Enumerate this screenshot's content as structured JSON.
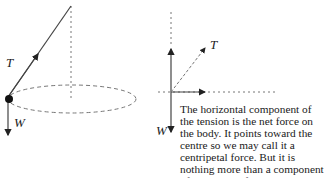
{
  "left_diagram": {
    "tension_label": "T",
    "weight_label": "W"
  },
  "right_diagram": {
    "tension_label": "T",
    "weight_label": "W"
  },
  "caption": {
    "text": "The horizontal component of the tension is the net force on the body. It points toward the centre so we may call it a centripetal force. But it is nothing more than a component of the tension force."
  },
  "colors": {
    "line": "#333333",
    "dashed": "#777777"
  }
}
